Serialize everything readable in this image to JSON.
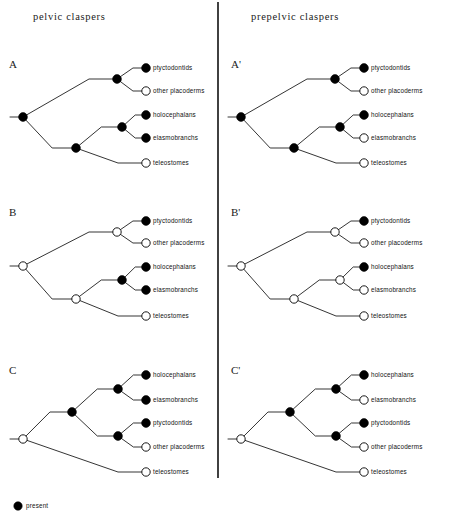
{
  "figure": {
    "width": 453,
    "height": 528,
    "background": "#ffffff",
    "ink": "#111111"
  },
  "columns": [
    {
      "id": "left",
      "title": "pelvic claspers",
      "title_x": 33,
      "title_y": 20
    },
    {
      "id": "right",
      "title": "prepelvic claspers",
      "title_x": 251,
      "title_y": 20
    }
  ],
  "divider": {
    "x": 218,
    "y1": 2,
    "y2": 478
  },
  "legend": {
    "symbol": "filled-circle",
    "label": "present",
    "circle_x": 18,
    "circle_y": 506,
    "radius": 4.2,
    "label_x": 26,
    "label_y": 508
  },
  "taxa": {
    "ptyctodontids": "ptyctodontids",
    "other_placoderms": "other  placoderms",
    "holocephalans": "holocephalans",
    "elasmobranchs": "elasmobranchs",
    "teleostomes": "teleostomes"
  },
  "geometry": {
    "left_origin_x": 10,
    "right_origin_x": 228,
    "tip_circle_x": 146,
    "label_offset_x": 7,
    "tip_radius_filled": 4.4,
    "tip_radius_open": 4.2,
    "node_radius_filled": 4.4,
    "node_radius_open": 4.2,
    "row_letter_offset_x": 9
  },
  "panels": [
    {
      "id": "A",
      "letter": "A",
      "column": "left",
      "letter_x": 9,
      "letter_y": 68,
      "topology": "placoderm-grade",
      "root": {
        "x": 23,
        "y": 117,
        "state": "present",
        "stem_x": 10
      },
      "internal_nodes": [
        {
          "name": "ptyctodont-placoderm-node",
          "x": 117,
          "y": 79,
          "state": "present"
        },
        {
          "name": "chondrichthyan-stem-node",
          "x": 76,
          "y": 148,
          "state": "present"
        },
        {
          "name": "crown-chondrichthyan-node",
          "x": 122,
          "y": 127,
          "state": "present"
        }
      ],
      "tips": [
        {
          "taxon": "ptyctodontids",
          "y": 68,
          "state": "present"
        },
        {
          "taxon": "other_placoderms",
          "y": 91,
          "state": "absent"
        },
        {
          "taxon": "holocephalans",
          "y": 115,
          "state": "present"
        },
        {
          "taxon": "elasmobranchs",
          "y": 138,
          "state": "present"
        },
        {
          "taxon": "teleostomes",
          "y": 163,
          "state": "absent"
        }
      ]
    },
    {
      "id": "Aprime",
      "letter": "A'",
      "column": "right",
      "letter_x": 231,
      "letter_y": 68,
      "topology": "placoderm-grade",
      "root": {
        "x": 241,
        "y": 117,
        "state": "present",
        "stem_x": 228
      },
      "internal_nodes": [
        {
          "name": "ptyctodont-placoderm-node",
          "x": 335,
          "y": 79,
          "state": "present"
        },
        {
          "name": "chondrichthyan-stem-node",
          "x": 294,
          "y": 148,
          "state": "present"
        },
        {
          "name": "crown-chondrichthyan-node",
          "x": 340,
          "y": 127,
          "state": "present"
        }
      ],
      "tips": [
        {
          "taxon": "ptyctodontids",
          "y": 68,
          "state": "present"
        },
        {
          "taxon": "other_placoderms",
          "y": 91,
          "state": "absent"
        },
        {
          "taxon": "holocephalans",
          "y": 115,
          "state": "present"
        },
        {
          "taxon": "elasmobranchs",
          "y": 138,
          "state": "absent"
        },
        {
          "taxon": "teleostomes",
          "y": 163,
          "state": "absent"
        }
      ]
    },
    {
      "id": "B",
      "letter": "B",
      "column": "left",
      "letter_x": 9,
      "letter_y": 216,
      "topology": "placoderm-grade",
      "root": {
        "x": 23,
        "y": 266,
        "state": "absent",
        "stem_x": 10
      },
      "internal_nodes": [
        {
          "name": "ptyctodont-placoderm-node",
          "x": 117,
          "y": 232,
          "state": "absent"
        },
        {
          "name": "chondrichthyan-stem-node",
          "x": 76,
          "y": 299,
          "state": "absent"
        },
        {
          "name": "crown-chondrichthyan-node",
          "x": 122,
          "y": 280,
          "state": "present"
        }
      ],
      "tips": [
        {
          "taxon": "ptyctodontids",
          "y": 221,
          "state": "present"
        },
        {
          "taxon": "other_placoderms",
          "y": 243,
          "state": "absent"
        },
        {
          "taxon": "holocephalans",
          "y": 267,
          "state": "present"
        },
        {
          "taxon": "elasmobranchs",
          "y": 290,
          "state": "present"
        },
        {
          "taxon": "teleostomes",
          "y": 316,
          "state": "absent"
        }
      ]
    },
    {
      "id": "Bprime",
      "letter": "B'",
      "column": "right",
      "letter_x": 231,
      "letter_y": 216,
      "topology": "placoderm-grade",
      "root": {
        "x": 241,
        "y": 266,
        "state": "absent",
        "stem_x": 228
      },
      "internal_nodes": [
        {
          "name": "ptyctodont-placoderm-node",
          "x": 335,
          "y": 232,
          "state": "absent"
        },
        {
          "name": "chondrichthyan-stem-node",
          "x": 294,
          "y": 299,
          "state": "absent"
        },
        {
          "name": "crown-chondrichthyan-node",
          "x": 340,
          "y": 280,
          "state": "absent"
        }
      ],
      "tips": [
        {
          "taxon": "ptyctodontids",
          "y": 221,
          "state": "present"
        },
        {
          "taxon": "other_placoderms",
          "y": 243,
          "state": "absent"
        },
        {
          "taxon": "holocephalans",
          "y": 267,
          "state": "present"
        },
        {
          "taxon": "elasmobranchs",
          "y": 290,
          "state": "absent"
        },
        {
          "taxon": "teleostomes",
          "y": 316,
          "state": "absent"
        }
      ]
    },
    {
      "id": "C",
      "letter": "C",
      "column": "left",
      "letter_x": 9,
      "letter_y": 374,
      "topology": "placoderm-monophyly",
      "root": {
        "x": 23,
        "y": 439,
        "state": "absent",
        "stem_x": 10
      },
      "internal_nodes": [
        {
          "name": "gnathostome-crown-node",
          "x": 72,
          "y": 412,
          "state": "present"
        },
        {
          "name": "crown-chondrichthyan-node",
          "x": 118,
          "y": 389,
          "state": "present"
        },
        {
          "name": "placoderm-clade-node",
          "x": 118,
          "y": 436,
          "state": "present"
        }
      ],
      "tips": [
        {
          "taxon": "holocephalans",
          "y": 375,
          "state": "present"
        },
        {
          "taxon": "elasmobranchs",
          "y": 400,
          "state": "present"
        },
        {
          "taxon": "ptyctodontids",
          "y": 423,
          "state": "present"
        },
        {
          "taxon": "other_placoderms",
          "y": 447,
          "state": "absent"
        },
        {
          "taxon": "teleostomes",
          "y": 472,
          "state": "absent"
        }
      ]
    },
    {
      "id": "Cprime",
      "letter": "C'",
      "column": "right",
      "letter_x": 231,
      "letter_y": 374,
      "topology": "placoderm-monophyly",
      "root": {
        "x": 241,
        "y": 439,
        "state": "absent",
        "stem_x": 228
      },
      "internal_nodes": [
        {
          "name": "gnathostome-crown-node",
          "x": 290,
          "y": 412,
          "state": "present"
        },
        {
          "name": "crown-chondrichthyan-node",
          "x": 336,
          "y": 389,
          "state": "present"
        },
        {
          "name": "placoderm-clade-node",
          "x": 336,
          "y": 436,
          "state": "present"
        }
      ],
      "tips": [
        {
          "taxon": "holocephalans",
          "y": 375,
          "state": "present"
        },
        {
          "taxon": "elasmobranchs",
          "y": 400,
          "state": "absent"
        },
        {
          "taxon": "ptyctodontids",
          "y": 423,
          "state": "present"
        },
        {
          "taxon": "other_placoderms",
          "y": 447,
          "state": "absent"
        },
        {
          "taxon": "teleostomes",
          "y": 472,
          "state": "absent"
        }
      ]
    }
  ]
}
